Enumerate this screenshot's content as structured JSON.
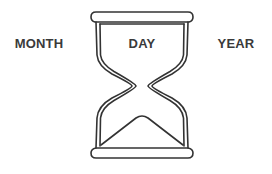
{
  "labels": {
    "month": "MONTH",
    "day": "DAY",
    "year": "YEAR"
  },
  "icon": "hourglass-icon",
  "colors": {
    "stroke": "#333333",
    "text": "#3a3a3a",
    "background": "#ffffff"
  }
}
